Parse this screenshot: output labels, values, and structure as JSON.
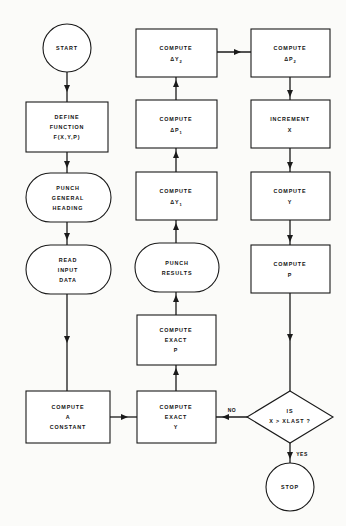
{
  "diagram": {
    "background_color": "#fbfbf9",
    "line_color": "#1a1a1a",
    "fill_color": "#ffffff"
  },
  "nodes": {
    "start": {
      "label": "START",
      "shape": "circle"
    },
    "define_function": {
      "line1": "DEFINE",
      "line2": "FUNCTION",
      "line3": "F(X,Y,P)",
      "shape": "rect"
    },
    "punch_general_heading": {
      "line1": "PUNCH",
      "line2": "GENERAL",
      "line3": "HEADING",
      "shape": "stadium"
    },
    "read_input_data": {
      "line1": "READ",
      "line2": "INPUT",
      "line3": "DATA",
      "shape": "stadium"
    },
    "compute_a_constant": {
      "line1": "COMPUTE",
      "line2": "A",
      "line3": "CONSTANT",
      "shape": "rect"
    },
    "compute_exact_y": {
      "line1": "COMPUTE",
      "line2": "EXACT",
      "line3": "Y",
      "shape": "rect"
    },
    "compute_exact_p": {
      "line1": "COMPUTE",
      "line2": "EXACT",
      "line3": "P",
      "shape": "rect"
    },
    "punch_results": {
      "line1": "PUNCH",
      "line2": "RESULTS",
      "shape": "stadium"
    },
    "compute_delta_y1": {
      "line1": "COMPUTE",
      "line2": "ΔY",
      "sub": "1",
      "shape": "rect"
    },
    "compute_delta_p1": {
      "line1": "COMPUTE",
      "line2": "ΔP",
      "sub": "1",
      "shape": "rect"
    },
    "compute_delta_y2": {
      "line1": "COMPUTE",
      "line2": "ΔY",
      "sub": "2",
      "shape": "rect"
    },
    "compute_delta_p2": {
      "line1": "COMPUTE",
      "line2": "ΔP",
      "sub": "2",
      "shape": "rect"
    },
    "increment_x": {
      "line1": "INCREMENT",
      "line2": "X",
      "shape": "rect"
    },
    "compute_y": {
      "line1": "COMPUTE",
      "line2": "Y",
      "shape": "rect"
    },
    "compute_p": {
      "line1": "COMPUTE",
      "line2": "P",
      "shape": "rect"
    },
    "decision_xlast": {
      "line1": "IS",
      "line2": "X > XLAST ?",
      "shape": "diamond"
    },
    "stop": {
      "label": "STOP",
      "shape": "circle"
    }
  },
  "edge_labels": {
    "no": "NO",
    "yes": "YES"
  }
}
